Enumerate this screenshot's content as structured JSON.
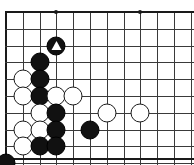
{
  "board": {
    "type": "go-board-diagram",
    "description": "Go game position, upper-left corner section of a 19x19 board",
    "columns": 12,
    "rows": 9,
    "cell_size": 16.8,
    "origin_x": 6,
    "origin_y": 12,
    "colors": {
      "background": "#ffffff",
      "gridline": "#3a3a3a",
      "edge": "#1a1a1a",
      "black_stone": "#111111",
      "white_stone": "#ffffff",
      "stone_outline": "#1a1a1a"
    },
    "star_points": [
      {
        "col": 4,
        "row": 1
      },
      {
        "col": 9,
        "row": 1
      },
      {
        "col": 9,
        "row": 7
      }
    ],
    "stones": [
      {
        "col": 4,
        "row": 3,
        "color": "black",
        "mark": "triangle"
      },
      {
        "col": 3,
        "row": 4,
        "color": "black",
        "mark": null
      },
      {
        "col": 2,
        "row": 5,
        "color": "white",
        "mark": null
      },
      {
        "col": 3,
        "row": 5,
        "color": "black",
        "mark": null
      },
      {
        "col": 2,
        "row": 6,
        "color": "white",
        "mark": null
      },
      {
        "col": 3,
        "row": 6,
        "color": "black",
        "mark": null
      },
      {
        "col": 4,
        "row": 6,
        "color": "white",
        "mark": null
      },
      {
        "col": 5,
        "row": 6,
        "color": "white",
        "mark": null
      },
      {
        "col": 3,
        "row": 7,
        "color": "white",
        "mark": null
      },
      {
        "col": 4,
        "row": 7,
        "color": "black",
        "mark": null
      },
      {
        "col": 7,
        "row": 7,
        "color": "white",
        "mark": null
      },
      {
        "col": 9,
        "row": 7,
        "color": "white",
        "mark": null
      },
      {
        "col": 2,
        "row": 8,
        "color": "white",
        "mark": null
      },
      {
        "col": 3,
        "row": 8,
        "color": "white",
        "mark": null
      },
      {
        "col": 4,
        "row": 8,
        "color": "black",
        "mark": null
      },
      {
        "col": 6,
        "row": 8,
        "color": "black",
        "mark": null
      },
      {
        "col": 2,
        "row": 9,
        "color": "white",
        "mark": null
      },
      {
        "col": 3,
        "row": 9,
        "color": "black",
        "mark": null
      },
      {
        "col": 4,
        "row": 9,
        "color": "black",
        "mark": null
      },
      {
        "col": 1,
        "row": 10,
        "color": "black",
        "mark": null
      }
    ]
  }
}
